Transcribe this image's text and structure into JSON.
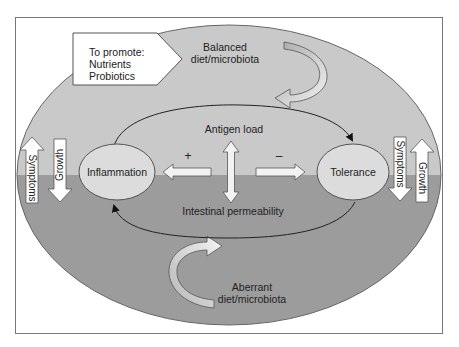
{
  "diagram": {
    "promote_box": {
      "title": "To promote:",
      "items": [
        "Nutrients",
        "Probiotics"
      ]
    },
    "top_input": {
      "line1": "Balanced",
      "line2": "diet/microbiota"
    },
    "bottom_input": {
      "line1": "Aberrant",
      "line2": "diet/microbiota"
    },
    "nodes": {
      "left": "Inflammation",
      "right": "Tolerance"
    },
    "loop_labels": {
      "top": "Antigen load",
      "bottom": "Intestinal permeability"
    },
    "signs": {
      "left": "+",
      "right": "–"
    },
    "side_arrows": {
      "left": [
        {
          "label": "Symptoms",
          "direction": "up"
        },
        {
          "label": "Growth",
          "direction": "down"
        }
      ],
      "right": [
        {
          "label": "Symptoms",
          "direction": "down"
        },
        {
          "label": "Growth",
          "direction": "up"
        }
      ]
    },
    "colors": {
      "upper_zone": "#c9c9c9",
      "lower_zone": "#9c9c9c",
      "node_fill": "#dcdcdc",
      "arrow_fill": "#f2f2f2",
      "outline": "#555555"
    }
  }
}
